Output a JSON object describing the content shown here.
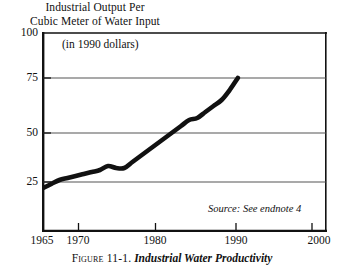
{
  "chart_data": {
    "type": "line",
    "title": "",
    "ylabel": "Industrial Output Per\nCubic Meter of Water Input",
    "xlabel": "",
    "units_note": "(in 1990 dollars)",
    "source_note": "Source: See endnote 4",
    "caption_number": "Figure 11-1.",
    "caption_title": "Industrial Water Productivity",
    "xlim": [
      1965,
      2000
    ],
    "ylim": [
      0,
      100
    ],
    "ytick_labels": [
      "100",
      "75",
      "50",
      "25"
    ],
    "ytick_values": [
      100,
      75,
      50,
      25
    ],
    "xtick_labels": [
      "1965",
      "1970",
      "1980",
      "1990",
      "2000"
    ],
    "xtick_values": [
      1965,
      1970,
      1980,
      1990,
      2000
    ],
    "grid": "horizontal",
    "legend": "none",
    "series": [
      {
        "name": "Industrial output per cubic meter of water input",
        "x": [
          1965,
          1966,
          1967,
          1968,
          1969,
          1970,
          1971,
          1972,
          1973,
          1974,
          1975,
          1976,
          1977,
          1978,
          1979,
          1980,
          1981,
          1982,
          1983,
          1984,
          1985,
          1986,
          1987,
          1988,
          1989
        ],
        "values": [
          22,
          24,
          26,
          27,
          28,
          29,
          30,
          31,
          33,
          32,
          32,
          35,
          38,
          41,
          44,
          47,
          50,
          53,
          56,
          57,
          60,
          63,
          66,
          71,
          77
        ]
      }
    ]
  }
}
